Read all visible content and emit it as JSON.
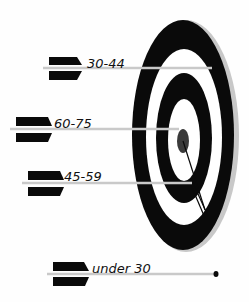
{
  "diagram": {
    "type": "target-with-arrows",
    "colors": {
      "ring_dark": "#0a0a0a",
      "ring_light": "#ffffff",
      "rim": "#c8c8c8",
      "bullseye": "#3a3a3a",
      "shaft": "#c9c9c9",
      "fletch": "#0a0a0a"
    },
    "arrows": [
      {
        "label": "30-44",
        "position": "outer ring (hit)"
      },
      {
        "label": "60-75",
        "position": "bullseye"
      },
      {
        "label": "45-59",
        "position": "inner ring"
      },
      {
        "label": "under 30",
        "position": "missed target"
      }
    ]
  }
}
